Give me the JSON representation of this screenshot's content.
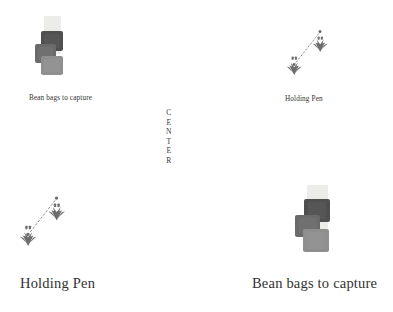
{
  "canvas": {
    "width": 393,
    "height": 312,
    "background": "#ffffff"
  },
  "center_marker": {
    "name": "CENTER",
    "letters": [
      "C",
      "E",
      "N",
      "T",
      "E",
      "R"
    ],
    "orientation": "vertical"
  },
  "palette": {
    "bag_dark": "#4e4e4e",
    "bag_mid": "#666666",
    "bag_light": "#8d8d8d",
    "strip_pale": "#e9e9e6",
    "pen_ink": "#6d6d6d",
    "text": "#313131"
  },
  "quadrants": [
    {
      "id": "top-left",
      "type": "beanbags",
      "label": "Bean bags to capture",
      "label_size": "small",
      "bag_count": 3,
      "bags": [
        {
          "shade": "#4f4f4f",
          "name": "bean-bag-dark"
        },
        {
          "shade": "#6a6a6a",
          "name": "bean-bag-mid"
        },
        {
          "shade": "#8f8f8f",
          "name": "bean-bag-light"
        }
      ]
    },
    {
      "id": "top-right",
      "type": "holdingpen",
      "label": "Holding Pen",
      "label_size": "small",
      "tuft_count": 2
    },
    {
      "id": "bottom-left",
      "type": "holdingpen",
      "label": "Holding Pen",
      "label_size": "large",
      "tuft_count": 2
    },
    {
      "id": "bottom-right",
      "type": "beanbags",
      "label": "Bean bags to capture",
      "label_size": "large",
      "bag_count": 3,
      "bags": [
        {
          "shade": "#4f4f4f",
          "name": "bean-bag-dark"
        },
        {
          "shade": "#6a6a6a",
          "name": "bean-bag-mid"
        },
        {
          "shade": "#8f8f8f",
          "name": "bean-bag-light"
        }
      ]
    }
  ]
}
